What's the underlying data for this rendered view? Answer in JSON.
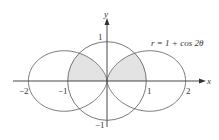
{
  "figure": {
    "type": "polar-region-diagram",
    "equation_label": "r = 1 + cos 2θ",
    "axes": {
      "x_label": "x",
      "y_label": "y",
      "x_ticks": [
        {
          "value": -2,
          "label": "−2"
        },
        {
          "value": -1,
          "label": "−1"
        },
        {
          "value": 1,
          "label": "1"
        },
        {
          "value": 2,
          "label": "2"
        }
      ],
      "y_ticks": [
        {
          "value": 1,
          "label": "1"
        },
        {
          "value": -1,
          "label": "−1"
        }
      ]
    },
    "curves": [
      {
        "name": "unit-circle",
        "polar": "r = 1"
      },
      {
        "name": "two-petal-curve",
        "polar": "r = 1 + cos 2θ"
      }
    ],
    "shaded_region": "inside both r = 1 and r = 1 + cos 2θ, above the x-axis",
    "colors": {
      "stroke": "#555555",
      "shade": "#e3e3e3",
      "axis": "#333333"
    }
  }
}
